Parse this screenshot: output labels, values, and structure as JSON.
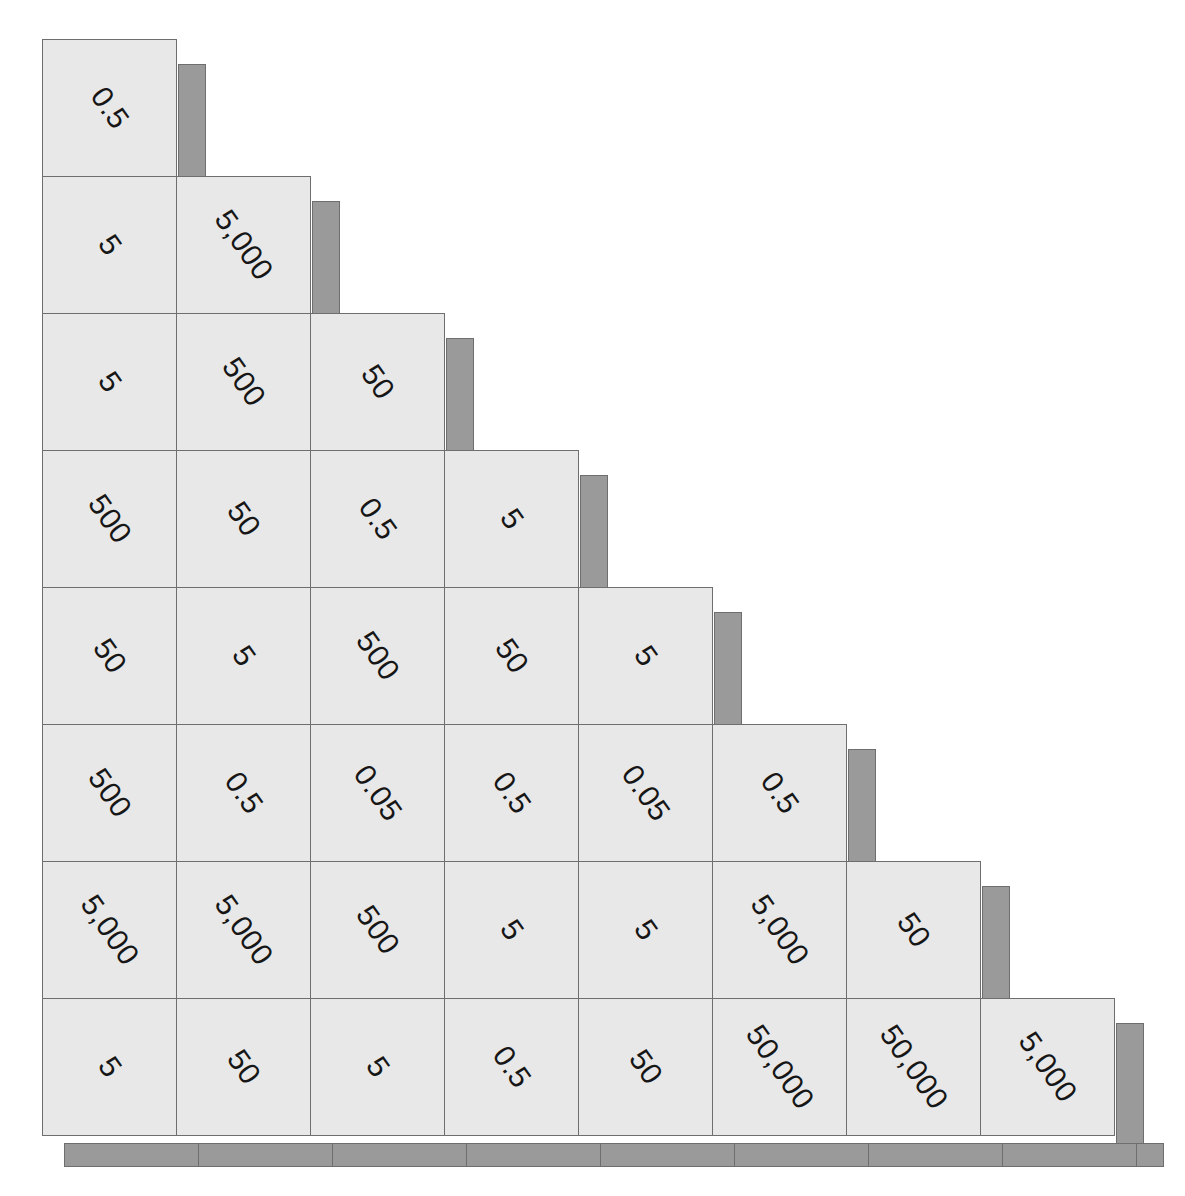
{
  "figure": {
    "name": "triangular-value-matrix",
    "type": "lower-triangular matrix of numeric labels",
    "rows": 8,
    "columns": 8,
    "cell_fill_color": "#e8e8e8",
    "cell_border_color": "#6e6e6e",
    "shadow_color": "#9a9a9a",
    "label_color": "#161616",
    "label_rotation_degrees": 55,
    "background_color": "#ffffff"
  },
  "chart_data": {
    "type": "heatmap",
    "title": "",
    "xlabel": "",
    "ylabel": "",
    "grid": true,
    "legend": "none",
    "shape": "lower-triangular",
    "rows": 8,
    "columns": 8,
    "categories": [
      "1",
      "2",
      "3",
      "4",
      "5",
      "6",
      "7",
      "8"
    ],
    "cell_text": [
      [
        "0.5"
      ],
      [
        "5",
        "5,000"
      ],
      [
        "5",
        "500",
        "50"
      ],
      [
        "500",
        "50",
        "0.5",
        "5"
      ],
      [
        "50",
        "5",
        "500",
        "50",
        "5"
      ],
      [
        "500",
        "0.5",
        "0.05",
        "0.5",
        "0.05",
        "0.5"
      ],
      [
        "5,000",
        "5,000",
        "500",
        "5",
        "5",
        "5,000",
        "50"
      ],
      [
        "5",
        "50",
        "5",
        "0.5",
        "50",
        "50,000",
        "50,000",
        "5,000"
      ]
    ],
    "values": [
      [
        0.5
      ],
      [
        5,
        5000
      ],
      [
        5,
        500,
        50
      ],
      [
        500,
        50,
        0.5,
        5
      ],
      [
        50,
        5,
        500,
        50,
        5
      ],
      [
        500,
        0.5,
        0.05,
        0.5,
        0.05,
        0.5
      ],
      [
        5000,
        5000,
        500,
        5,
        5,
        5000,
        50
      ],
      [
        5,
        50,
        5,
        0.5,
        50,
        50000,
        50000,
        5000
      ]
    ],
    "distinct_values": [
      "0.05",
      "0.5",
      "5",
      "50",
      "500",
      "5,000",
      "50,000"
    ]
  },
  "base_shadow": {
    "segment_count": 8
  }
}
